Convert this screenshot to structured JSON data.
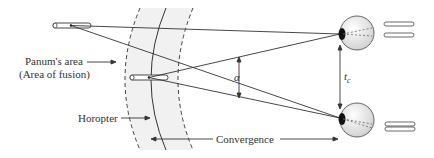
{
  "labels": {
    "panum_line1": "Panum's area",
    "panum_line2": "(Area of fusion)",
    "horopter": "Horopter",
    "convergence": "Convergence",
    "alpha": "α",
    "tc_main": "t",
    "tc_sub": "c"
  },
  "colors": {
    "line": "#333333",
    "panum_fill": "#f0f0f0",
    "eye_fill": "#e4e4e4",
    "pupil": "#111111"
  }
}
